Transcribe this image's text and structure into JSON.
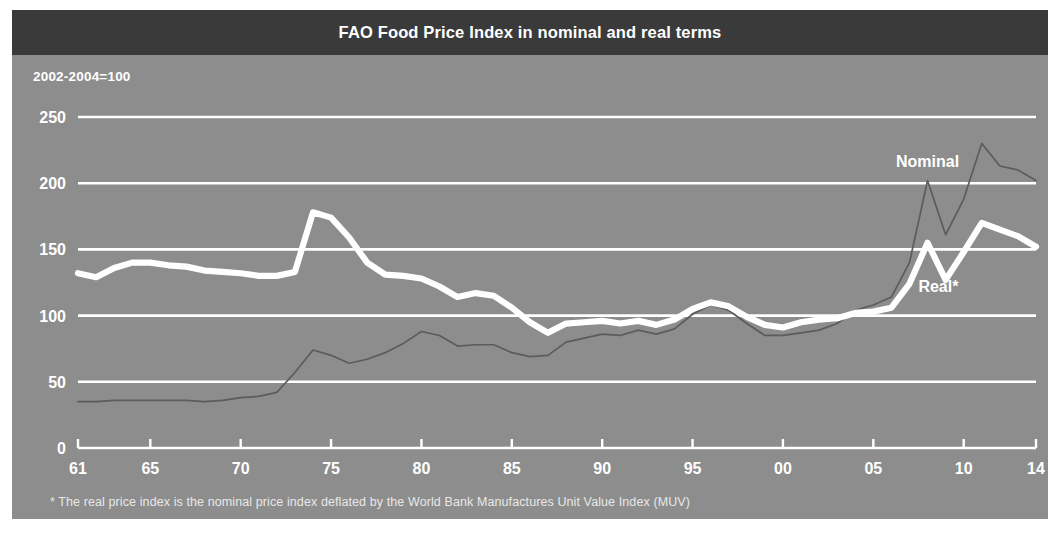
{
  "figure": {
    "title": "FAO Food Price Index in nominal and real terms",
    "unit_note": "2002-2004=100",
    "footnote": "* The real price index is the nominal price index deflated by the World Bank Manufactures Unit Value Index (MUV)",
    "colors": {
      "title_bar_background": "#3a3a3a",
      "title_text": "#ffffff",
      "panel_background": "#8d8d8d",
      "gridline": "#ffffff",
      "real_series": "#ffffff",
      "nominal_series": "#5c5c5c",
      "page_background": "#ffffff"
    }
  },
  "chart_data": {
    "type": "line",
    "title": "FAO Food Price Index in nominal and real terms",
    "subtitle": "2002-2004=100",
    "xlabel": "",
    "ylabel": "",
    "ylim": [
      0,
      260
    ],
    "xlim": [
      1961,
      2014
    ],
    "grid": true,
    "gridlines_y": [
      0,
      50,
      100,
      150,
      200,
      250
    ],
    "ytick_labels": [
      "0",
      "50",
      "100",
      "150",
      "200",
      "250"
    ],
    "ytick_values": [
      0,
      50,
      100,
      150,
      200,
      250
    ],
    "xtick_labels": [
      "61",
      "65",
      "70",
      "75",
      "80",
      "85",
      "90",
      "95",
      "00",
      "05",
      "10",
      "14"
    ],
    "xtick_values": [
      1961,
      1965,
      1970,
      1975,
      1980,
      1985,
      1990,
      1995,
      2000,
      2005,
      2010,
      2014
    ],
    "legend_position": "inline-annotation",
    "annotations": [
      {
        "label": "Nominal",
        "x": 2008,
        "y": 212
      },
      {
        "label": "Real*",
        "x": 2008.6,
        "y": 118
      }
    ],
    "x": [
      1961,
      1962,
      1963,
      1964,
      1965,
      1966,
      1967,
      1968,
      1969,
      1970,
      1971,
      1972,
      1973,
      1974,
      1975,
      1976,
      1977,
      1978,
      1979,
      1980,
      1981,
      1982,
      1983,
      1984,
      1985,
      1986,
      1987,
      1988,
      1989,
      1990,
      1991,
      1992,
      1993,
      1994,
      1995,
      1996,
      1997,
      1998,
      1999,
      2000,
      2001,
      2002,
      2003,
      2004,
      2005,
      2006,
      2007,
      2008,
      2009,
      2010,
      2011,
      2012,
      2013,
      2014
    ],
    "series": [
      {
        "name": "Nominal",
        "color": "#5c5c5c",
        "style": "thin",
        "values": [
          35,
          35,
          36,
          36,
          36,
          36,
          36,
          35,
          36,
          38,
          39,
          42,
          57,
          74,
          70,
          64,
          67,
          72,
          79,
          88,
          85,
          77,
          78,
          78,
          72,
          69,
          70,
          80,
          83,
          86,
          85,
          89,
          86,
          90,
          101,
          108,
          104,
          94,
          85,
          85,
          87,
          89,
          94,
          104,
          108,
          114,
          140,
          202,
          161,
          188,
          230,
          213,
          210,
          202
        ]
      },
      {
        "name": "Real*",
        "color": "#ffffff",
        "style": "thick",
        "values": [
          132,
          129,
          136,
          140,
          140,
          138,
          137,
          134,
          133,
          132,
          130,
          130,
          133,
          178,
          174,
          159,
          140,
          131,
          130,
          128,
          122,
          114,
          117,
          115,
          106,
          95,
          87,
          94,
          95,
          96,
          94,
          96,
          93,
          97,
          105,
          110,
          107,
          99,
          93,
          91,
          95,
          97,
          98,
          102,
          103,
          106,
          124,
          155,
          127,
          148,
          170,
          165,
          160,
          152
        ]
      }
    ]
  }
}
